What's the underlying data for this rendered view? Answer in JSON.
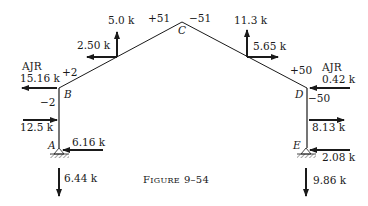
{
  "figure": {
    "caption_prefix": "F",
    "caption_smallcaps": "IGURE",
    "caption_number": "9–54"
  },
  "nodes": {
    "A": "A",
    "B": "B",
    "C": "C",
    "D": "D",
    "E": "E"
  },
  "moments": {
    "B_beam": "+2",
    "B_column": "−2",
    "C_left": "+51",
    "C_right": "−51",
    "D_beam": "+50",
    "D_column": "−50"
  },
  "loads": {
    "left_rafter_vertical": "5.0 k",
    "left_rafter_horizontal": "2.50 k",
    "right_rafter_vertical": "11.3 k",
    "right_rafter_horizontal": "5.65 k",
    "B_ajr_label": "AJR",
    "B_ajr_value": "15.16 k",
    "D_ajr_label": "AJR",
    "D_ajr_value": "0.42 k",
    "left_column_load": "12.5 k",
    "right_column_load": "8.13 k",
    "A_horizontal_reaction": "6.16 k",
    "A_vertical_reaction": "6.44 k",
    "E_horizontal_reaction": "2.08 k",
    "E_vertical_reaction": "9.86 k"
  },
  "colors": {
    "line": "#1a1a1a",
    "background": "#ffffff"
  }
}
